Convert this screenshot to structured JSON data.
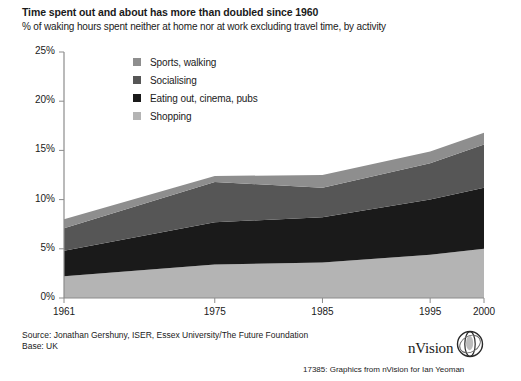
{
  "chart_data": {
    "type": "area",
    "title": "Time spent out and about has more than doubled since 1960",
    "subtitle": "% of waking hours spent neither at home nor at work excluding travel time, by activity",
    "xlabel": "",
    "ylabel": "",
    "stacked": true,
    "grid": false,
    "legend_position": "inside-top-left",
    "x": [
      1961,
      1975,
      1985,
      1995,
      2000
    ],
    "categories": [
      "1961",
      "1975",
      "1985",
      "1995",
      "2000"
    ],
    "xtick_labels": [
      "1961",
      "1975",
      "1985",
      "1995",
      "2000"
    ],
    "ytick_labels": [
      "0%",
      "5%",
      "10%",
      "15%",
      "20%",
      "25%"
    ],
    "ytick_values": [
      0,
      5,
      10,
      15,
      20,
      25
    ],
    "ylim": [
      0,
      25
    ],
    "xlim": [
      1961,
      2000
    ],
    "series": [
      {
        "name": "Shopping",
        "color": "#b4b4b4",
        "values": [
          2.2,
          3.4,
          3.6,
          4.4,
          5.0
        ]
      },
      {
        "name": "Eating out, cinema, pubs",
        "color": "#1a1a1a",
        "values": [
          2.6,
          4.3,
          4.6,
          5.6,
          6.2
        ]
      },
      {
        "name": "Socialising",
        "color": "#565656",
        "values": [
          2.3,
          4.1,
          3.0,
          3.7,
          4.4
        ]
      },
      {
        "name": "Sports, walking",
        "color": "#8e8e8e",
        "values": [
          0.9,
          0.6,
          1.3,
          1.2,
          1.2
        ]
      }
    ],
    "stack_totals": [
      8.0,
      12.4,
      12.5,
      14.9,
      16.8
    ]
  },
  "legend": {
    "items": [
      {
        "label": "Sports, walking",
        "color": "#8e8e8e"
      },
      {
        "label": "Socialising",
        "color": "#565656"
      },
      {
        "label": "Eating out, cinema, pubs",
        "color": "#1a1a1a"
      },
      {
        "label": "Shopping",
        "color": "#b4b4b4"
      }
    ]
  },
  "footer": {
    "source": "Source: Jonathan Gershuny, ISER, Essex University/The Future Foundation",
    "base": "Base: UK",
    "credit": "17385: Graphics from  nVision  for Ian Yeoman"
  },
  "branding": {
    "wordmark": "nVision"
  },
  "colors": {
    "axis": "#8c8c8c",
    "text": "#1a1a1a",
    "background": "#ffffff"
  }
}
